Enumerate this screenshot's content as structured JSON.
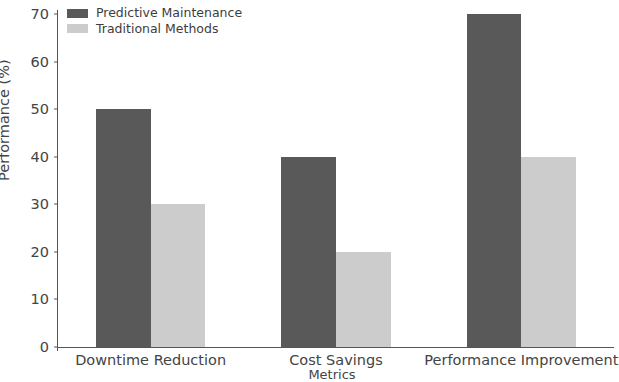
{
  "chart_data": {
    "type": "bar",
    "title": "",
    "xlabel": "Metrics",
    "ylabel": "Performance (%)",
    "categories": [
      "Downtime Reduction",
      "Cost Savings",
      "Performance Improvement"
    ],
    "series": [
      {
        "name": "Predictive Maintenance",
        "values": [
          50,
          40,
          70
        ],
        "color": "#595959"
      },
      {
        "name": "Traditional Methods",
        "values": [
          30,
          20,
          40
        ],
        "color": "#cccccc"
      }
    ],
    "ylim": [
      0,
      70
    ],
    "yticks": [
      0,
      10,
      20,
      30,
      40,
      50,
      60,
      70
    ],
    "ytick_labels": [
      "0",
      "10",
      "20",
      "30",
      "40",
      "50",
      "60",
      "70"
    ],
    "grid": false,
    "legend_position": "upper left",
    "background_color": "#ffffff",
    "axis_color": "#555555",
    "text_color": "#444444"
  }
}
